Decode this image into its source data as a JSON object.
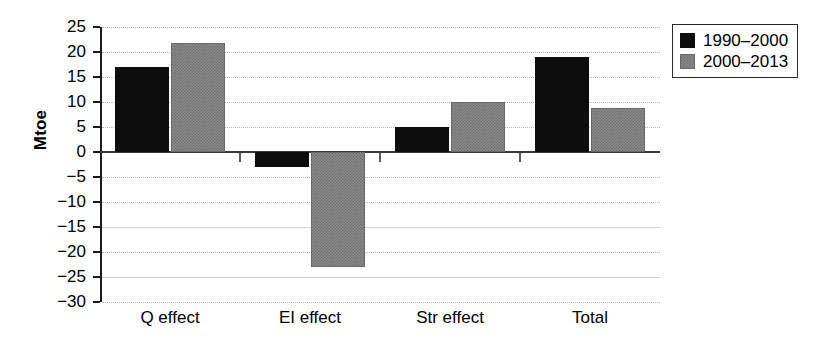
{
  "chart_data": {
    "type": "bar",
    "title": "",
    "xlabel": "",
    "ylabel": "Mtoe",
    "categories": [
      "Q effect",
      "EI effect",
      "Str effect",
      "Total"
    ],
    "series": [
      {
        "name": "1990–2000",
        "color": "#0d0d0d",
        "values": [
          17,
          -3,
          5,
          19
        ]
      },
      {
        "name": "2000–2013",
        "color": "#8a8a8a",
        "values": [
          21.8,
          -23,
          10,
          8.8
        ]
      }
    ],
    "ylim": [
      -30,
      25
    ],
    "ytick_values": [
      25,
      20,
      15,
      10,
      5,
      0,
      -5,
      -10,
      -15,
      -20,
      -25,
      -30
    ],
    "ytick_labels": [
      "25",
      "20",
      "15",
      "10",
      "5",
      "0",
      "−5",
      "−10",
      "−15",
      "−20",
      "−25",
      "−30"
    ],
    "grid": true,
    "legend_position": "top-right",
    "zero_line": true
  },
  "legend": {
    "entries": [
      {
        "label": "1990–2000",
        "swatch": "black-square"
      },
      {
        "label": "2000–2013",
        "swatch": "gray-square"
      }
    ]
  },
  "colors": {
    "series_1": "#0d0d0d",
    "series_2": "#8a8a8a",
    "axis": "#1a1a1a",
    "grid": "#b9b9b9",
    "background": "#ffffff"
  }
}
